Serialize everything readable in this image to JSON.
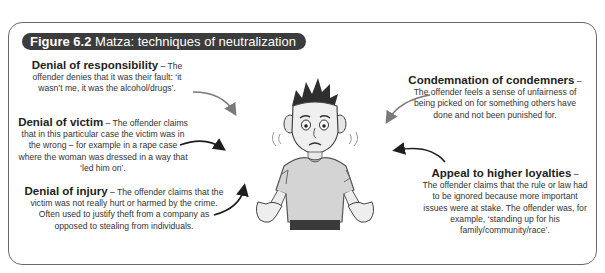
{
  "figure": {
    "number": "Figure 6.2",
    "title": "Matza: techniques of neutralization"
  },
  "techniques": {
    "responsibility": {
      "heading": "Denial of responsibility",
      "dash": " – ",
      "body": "The offender denies that it was their fault: ‘it wasn’t me, it was the alcohol/drugs’."
    },
    "victim": {
      "heading": "Denial of victim",
      "dash": " – ",
      "body": "The offender claims that in this particular case the victim was in the wrong – for example in a rape case where the woman was dressed in a way that ‘led him on’."
    },
    "injury": {
      "heading": "Denial of injury",
      "dash": " – ",
      "body": "The offender claims that the victim was not really hurt or harmed by the crime. Often used to justify theft from a company as opposed to stealing from individuals."
    },
    "condemners": {
      "heading": "Condemnation of condemners",
      "dash": " –",
      "body": "The offender feels a sense of unfairness of being picked on for something others have done and not been punished for."
    },
    "loyalties": {
      "heading": "Appeal to higher loyalties",
      "dash": " –",
      "body": "The offender claims that the rule or law had to be ignored because more important issues were at stake.  The offender was, for example, ‘standing up for his family/community/race’."
    }
  },
  "illustration": {
    "subject": "shrugging-young-man",
    "description": "Cartoon of a worried young man shrugging with palms up"
  },
  "colors": {
    "badge_bg": "#3c3c3c",
    "badge_text": "#ffffff",
    "frame_border": "#6a6a6a",
    "arrow_gray": "#7a7a7a",
    "arrow_black": "#1e1e1e"
  }
}
